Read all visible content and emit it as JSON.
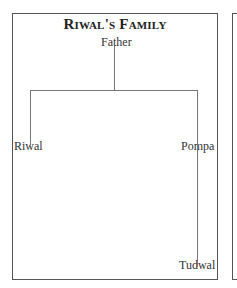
{
  "diagram": {
    "title": "Riwal's Family",
    "type": "family-tree",
    "nodes": {
      "father": "Father",
      "riwal": "Riwal",
      "pompa": "Pompa",
      "tudwal": "Tudwal"
    },
    "edges": [
      {
        "from": "Father",
        "to": "Riwal"
      },
      {
        "from": "Father",
        "to": "Pompa"
      },
      {
        "from": "Pompa",
        "to": "Tudwal"
      }
    ]
  }
}
